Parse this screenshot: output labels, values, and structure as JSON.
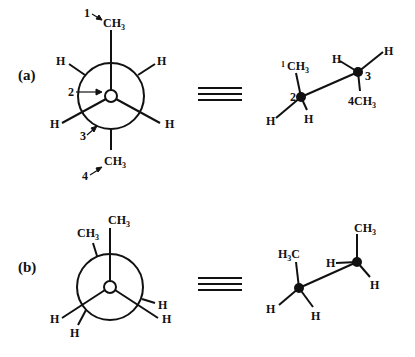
{
  "panels": [
    {
      "label": "(a)",
      "newman": {
        "front_top": "CH",
        "front_top_sub": "3",
        "back_bottom": "CH",
        "back_bottom_sub": "3",
        "h_upper_left": "H",
        "h_upper_right": "H",
        "h_lower_left": "H",
        "h_lower_right": "H",
        "numbers": {
          "n1": "1",
          "n2": "2",
          "n3": "3",
          "n4": "4"
        }
      },
      "equivalence_symbol": "≡",
      "sawhorse": {
        "c2_ch3": "CH",
        "c2_ch3_sub": "3",
        "c2_ch3_num": "1",
        "c2_label": "2",
        "c2_h_left": "H",
        "c2_h_right": "H",
        "c3_label": "3",
        "c3_h_left": "H",
        "c3_h_right": "H",
        "c3_ch3": "CH",
        "c3_ch3_sub": "3",
        "c3_ch3_num": "4"
      }
    },
    {
      "label": "(b)",
      "newman": {
        "front_top": "CH",
        "front_top_sub": "3",
        "back_upper_left": "CH",
        "back_upper_left_sub": "3",
        "h_lower_left": "H",
        "h_lower_left_back": "H",
        "h_right_back": "H",
        "h_lower_right": "H"
      },
      "equivalence_symbol": "≡",
      "sawhorse": {
        "c2_h3c_h": "H",
        "c2_h3c_sub": "3",
        "c2_h3c_c": "C",
        "c2_h_left": "H",
        "c2_h_right": "H",
        "c3_ch3": "CH",
        "c3_ch3_sub": "3",
        "c3_h_left": "H",
        "c3_h_right": "H"
      }
    }
  ]
}
